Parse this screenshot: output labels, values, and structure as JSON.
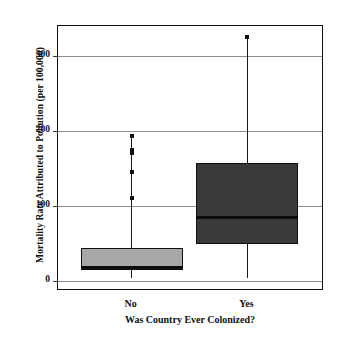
{
  "chart_data": {
    "type": "box",
    "title": "",
    "xlabel": "Was Country Ever Colonized?",
    "ylabel": "Mortality Rate Attributed to Pollution (per 100,000)",
    "categories": [
      "No",
      "Yes"
    ],
    "ylim": [
      -10,
      340
    ],
    "yticks": [
      0,
      100,
      200,
      300
    ],
    "ytick_labels": [
      "0",
      "100",
      "200",
      "300"
    ],
    "grid": true,
    "legend": "none",
    "boxes": [
      {
        "name": "No",
        "fill_color": "#a8a8a8",
        "whisker_low": 3,
        "q1": 14,
        "median": 17,
        "q3": 43,
        "whisker_high": 58,
        "outliers": [
          110,
          145,
          170,
          175,
          193
        ]
      },
      {
        "name": "Yes",
        "fill_color": "#3a3a3a",
        "whisker_low": 3,
        "q1": 49,
        "median": 84,
        "q3": 157,
        "whisker_high": 157,
        "outliers": [
          325
        ]
      }
    ]
  },
  "axis": {
    "y_title": "Mortality Rate Attributed to Pollution (per 100,000)",
    "x_title": "Was Country Ever Colonized?",
    "tick_0": "0",
    "tick_100": "100",
    "tick_200": "200",
    "tick_300": "300"
  },
  "xlabels": {
    "no": "No",
    "yes": "Yes"
  },
  "colors": {
    "frame": "#111111",
    "grid": "#8c8c8c",
    "box_no": "#a8a8a8",
    "box_yes": "#3a3a3a",
    "background": "#ffffff"
  }
}
